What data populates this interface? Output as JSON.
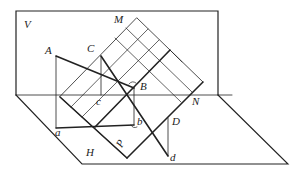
{
  "diagram": {
    "type": "descriptive-geometry-projection",
    "colors": {
      "line": "#222222",
      "background": "#ffffff"
    },
    "labels": {
      "V": "V",
      "H": "H",
      "M": "M",
      "N": "N",
      "A": "A",
      "C": "C",
      "B": "B",
      "c": "c",
      "a": "a",
      "b": "b",
      "D": "D",
      "d": "d",
      "P": "P"
    }
  }
}
